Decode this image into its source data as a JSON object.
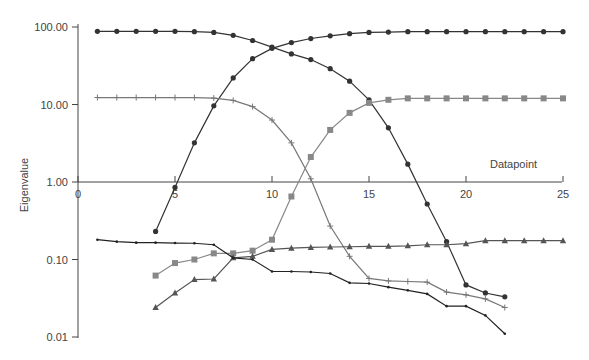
{
  "chart_data": {
    "type": "line",
    "title": "",
    "xlabel": "Datapoint",
    "ylabel": "Eigenvalue",
    "yscale": "log",
    "ylim": [
      0.01,
      100
    ],
    "xlim": [
      0,
      25
    ],
    "xticks": [
      "0",
      "5",
      "10",
      "15",
      "20",
      "25"
    ],
    "yticks": [
      "100.00",
      "10.00",
      "1.00",
      "0.10",
      "0.01"
    ],
    "grid": false,
    "series": [
      {
        "name": "circle-desc",
        "marker": "circle",
        "color": "#333333",
        "x": [
          1,
          2,
          3,
          4,
          5,
          6,
          7,
          8,
          9,
          10,
          11,
          12,
          13,
          14,
          15,
          16,
          17,
          18,
          19,
          20,
          21,
          22
        ],
        "values": [
          88,
          88,
          88,
          88,
          88,
          87,
          85,
          78,
          67,
          55,
          45,
          38,
          29,
          20,
          11.5,
          5,
          1.7,
          0.52,
          0.17,
          0.047,
          0.037,
          0.033
        ]
      },
      {
        "name": "circle-asc",
        "marker": "circle",
        "color": "#333333",
        "x": [
          4,
          5,
          6,
          7,
          8,
          9,
          10,
          11,
          12,
          13,
          14,
          15,
          16,
          17,
          18,
          19,
          20,
          21,
          22,
          23,
          24,
          25
        ],
        "values": [
          0.23,
          0.85,
          3.2,
          9.6,
          22,
          39,
          53,
          63,
          71,
          77,
          82,
          85,
          86,
          87,
          87,
          87,
          87,
          87,
          87,
          87,
          87,
          87
        ]
      },
      {
        "name": "plus",
        "marker": "plus",
        "color": "#777777",
        "x": [
          1,
          2,
          3,
          4,
          5,
          6,
          7,
          8,
          9,
          10,
          11,
          12,
          13,
          14,
          15,
          16,
          17,
          18,
          19,
          20,
          21,
          22
        ],
        "values": [
          12.3,
          12.3,
          12.3,
          12.3,
          12.3,
          12.3,
          12.1,
          11.3,
          9.4,
          6.3,
          3.2,
          1.1,
          0.27,
          0.11,
          0.057,
          0.053,
          0.052,
          0.051,
          0.038,
          0.035,
          0.031,
          0.024
        ]
      },
      {
        "name": "square",
        "marker": "square",
        "color": "#888888",
        "x": [
          4,
          5,
          6,
          7,
          8,
          9,
          10,
          11,
          12,
          13,
          14,
          15,
          16,
          17,
          18,
          19,
          20,
          21,
          22,
          23,
          24,
          25
        ],
        "values": [
          0.062,
          0.09,
          0.1,
          0.12,
          0.12,
          0.13,
          0.18,
          0.65,
          2.1,
          4.7,
          7.8,
          10.5,
          11.5,
          12,
          12,
          12,
          12,
          12,
          12,
          12,
          12,
          12
        ]
      },
      {
        "name": "triangle",
        "marker": "triangle",
        "color": "#555555",
        "x": [
          4,
          5,
          6,
          7,
          8,
          9,
          10,
          11,
          12,
          13,
          14,
          15,
          16,
          17,
          18,
          19,
          20,
          21,
          22,
          23,
          24,
          25
        ],
        "values": [
          0.024,
          0.037,
          0.055,
          0.056,
          0.105,
          0.11,
          0.135,
          0.14,
          0.143,
          0.145,
          0.146,
          0.148,
          0.148,
          0.15,
          0.155,
          0.155,
          0.16,
          0.175,
          0.175,
          0.175,
          0.175,
          0.175
        ]
      },
      {
        "name": "small-dot",
        "marker": "dot",
        "color": "#222222",
        "x": [
          1,
          2,
          3,
          4,
          5,
          6,
          7,
          8,
          9,
          10,
          11,
          12,
          13,
          14,
          15,
          16,
          17,
          18,
          19,
          20,
          21,
          22
        ],
        "values": [
          0.18,
          0.17,
          0.165,
          0.165,
          0.163,
          0.162,
          0.155,
          0.105,
          0.1,
          0.07,
          0.07,
          0.069,
          0.066,
          0.05,
          0.049,
          0.044,
          0.04,
          0.036,
          0.025,
          0.025,
          0.019,
          0.011
        ]
      }
    ]
  }
}
